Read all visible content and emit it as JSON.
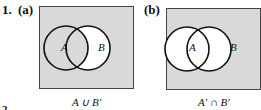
{
  "problem": {
    "number": "1.",
    "next_number_fragment": "2."
  },
  "diagrams": [
    {
      "label": "(a)",
      "caption": "A ∪ B′",
      "sets": [
        "A",
        "B"
      ],
      "shaded_region": "A ∪ B′",
      "colors": {
        "shade": "#d9d9d9",
        "unshaded": "#ffffff",
        "stroke": "#111111"
      }
    },
    {
      "label": "(b)",
      "caption": "A′ ∩ B′",
      "sets": [
        "A",
        "B"
      ],
      "shaded_region": "A′ ∩ B′",
      "colors": {
        "shade": "#d9d9d9",
        "unshaded": "#ffffff",
        "stroke": "#111111"
      }
    }
  ]
}
